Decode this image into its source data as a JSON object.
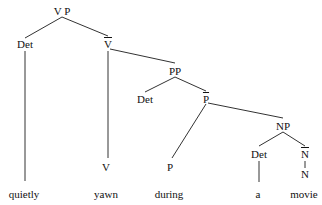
{
  "tree": {
    "nodes": [
      {
        "id": "vp",
        "label": "V P",
        "x": 62,
        "y": 5
      },
      {
        "id": "det1",
        "label": "Det",
        "x": 25,
        "y": 38
      },
      {
        "id": "vbar",
        "label": "V",
        "bar": true,
        "x": 108,
        "y": 38
      },
      {
        "id": "pp",
        "label": "PP",
        "x": 175,
        "y": 65
      },
      {
        "id": "det2",
        "label": "Det",
        "x": 145,
        "y": 93
      },
      {
        "id": "pbar",
        "label": "P",
        "bar": true,
        "x": 206,
        "y": 93
      },
      {
        "id": "np",
        "label": "NP",
        "x": 283,
        "y": 120
      },
      {
        "id": "det3",
        "label": "Det",
        "x": 259,
        "y": 148
      },
      {
        "id": "nbar",
        "label": "N",
        "bar": true,
        "x": 305,
        "y": 148
      },
      {
        "id": "v",
        "label": "V",
        "x": 106,
        "y": 161
      },
      {
        "id": "p",
        "label": "P",
        "x": 170,
        "y": 161
      },
      {
        "id": "n",
        "label": "N",
        "x": 305,
        "y": 168
      }
    ],
    "leaves": [
      {
        "id": "w1",
        "label": "quietly",
        "x": 24,
        "y": 188
      },
      {
        "id": "w2",
        "label": "yawn",
        "x": 106,
        "y": 188
      },
      {
        "id": "w3",
        "label": "during",
        "x": 169,
        "y": 188
      },
      {
        "id": "w4",
        "label": "a",
        "x": 258,
        "y": 188
      },
      {
        "id": "w5",
        "label": "movie",
        "x": 304,
        "y": 188
      }
    ],
    "edges": [
      [
        62,
        17,
        25,
        38
      ],
      [
        62,
        17,
        108,
        36
      ],
      [
        25,
        51,
        25,
        181
      ],
      [
        108,
        51,
        108,
        158
      ],
      [
        110,
        49,
        175,
        63
      ],
      [
        175,
        77,
        145,
        92
      ],
      [
        175,
        77,
        206,
        91
      ],
      [
        206,
        104,
        172,
        158
      ],
      [
        208,
        103,
        283,
        118
      ],
      [
        283,
        132,
        259,
        146
      ],
      [
        283,
        132,
        305,
        146
      ],
      [
        259,
        161,
        259,
        182
      ],
      [
        305,
        161,
        305,
        168
      ]
    ]
  }
}
